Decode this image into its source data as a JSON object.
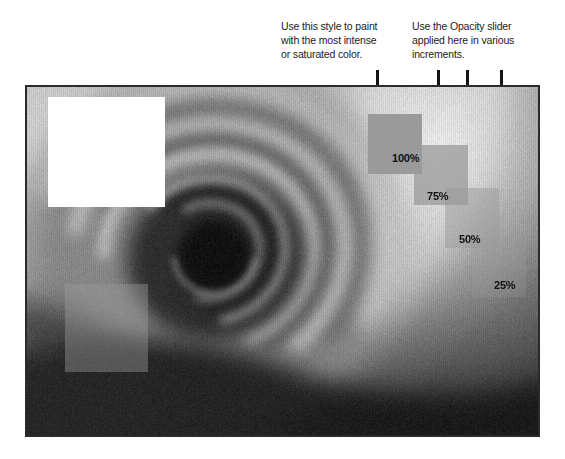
{
  "figure": {
    "photo": {
      "subject": "rose-photograph",
      "frame": {
        "x": 25,
        "y": 85,
        "width": 515,
        "height": 352
      },
      "border_color": "#2b2b2b"
    }
  },
  "callouts": [
    {
      "id": "callout-left",
      "text": "Use this style to paint with the most intense or saturated color.",
      "lines": [
        "Use this style to paint",
        "with the most intense",
        "or saturated color."
      ]
    },
    {
      "id": "callout-right",
      "text": "Use the Opacity slider applied here in various increments.",
      "lines": [
        "Use the Opacity slider",
        "applied here in various",
        "increments."
      ]
    }
  ],
  "leader_lines": [
    {
      "name": "leader-100",
      "x": 376,
      "top": 70,
      "bottom": 170
    },
    {
      "name": "leader-75",
      "x": 437,
      "top": 70,
      "bottom": 202
    },
    {
      "name": "leader-50",
      "x": 466,
      "top": 70,
      "bottom": 235
    },
    {
      "name": "leader-25",
      "x": 500,
      "top": 70,
      "bottom": 287
    }
  ],
  "paint_squares": [
    {
      "label": "100%",
      "opacity": 1.0,
      "x": 366,
      "y": 112,
      "width": 54,
      "height": 60,
      "label_x": 392,
      "label_y": 152
    },
    {
      "label": "75%",
      "opacity": 0.75,
      "x": 412,
      "y": 143,
      "width": 54,
      "height": 60,
      "label_x": 427,
      "label_y": 190
    },
    {
      "label": "50%",
      "opacity": 0.5,
      "x": 443,
      "y": 186,
      "width": 54,
      "height": 60,
      "label_x": 459,
      "label_y": 233
    },
    {
      "label": "25%",
      "opacity": 0.25,
      "x": 470,
      "y": 235,
      "width": 54,
      "height": 60,
      "label_x": 494,
      "label_y": 279
    }
  ],
  "demo_squares": [
    {
      "name": "white-paint-square",
      "color": "#ffffff",
      "opacity": 1.0,
      "x": 46,
      "y": 95,
      "width": 117,
      "height": 110
    },
    {
      "name": "gray-paint-square",
      "color": "#9a9a9a",
      "opacity": 0.42,
      "x": 63,
      "y": 282,
      "width": 83,
      "height": 88
    }
  ],
  "colors": {
    "paint": "#9a9a9a",
    "white_paint": "#ffffff",
    "leader": "#141414",
    "text": "#1b1b1b",
    "frame_border": "#2b2b2b"
  }
}
